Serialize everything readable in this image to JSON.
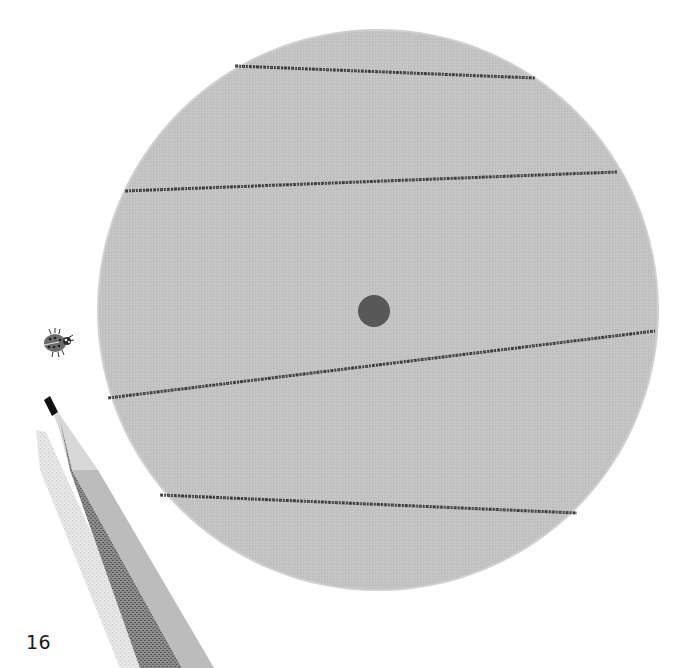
{
  "page": {
    "page_number": "16",
    "background_color": "#ffffff"
  },
  "disc": {
    "center_x": 378,
    "center_y": 310,
    "radius": 280,
    "fill_color": "#c2c2c2",
    "edge_color": "#b0b0b0"
  },
  "center_dot": {
    "cx": 374,
    "cy": 311,
    "r": 16,
    "color": "#585858"
  },
  "lines": [
    {
      "x1": 235,
      "y1": 66,
      "x2": 535,
      "y2": 78
    },
    {
      "x1": 125,
      "y1": 191,
      "x2": 617,
      "y2": 172
    },
    {
      "x1": 108,
      "y1": 398,
      "x2": 655,
      "y2": 331
    },
    {
      "x1": 160,
      "y1": 495,
      "x2": 577,
      "y2": 513
    }
  ],
  "line_color": "#3c3c3c",
  "ladybug": {
    "x": 55,
    "y": 343,
    "body_color": "#6a6a6a",
    "spot_color": "#2a2a2a"
  },
  "pencil": {
    "tip_color": "#111111",
    "wood_color": "#d6d6d6",
    "body_light_color": "#bdbdbd",
    "body_dark_color": "#7c7c7c",
    "shadow_color": "#dedede"
  }
}
